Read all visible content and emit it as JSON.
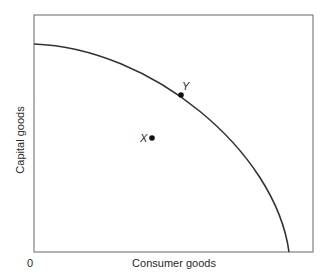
{
  "diagram": {
    "axes": {
      "x_label": "Consumer goods",
      "y_label": "Capital goods",
      "origin_label": "0"
    },
    "points": [
      {
        "label": "Y",
        "position": "on curve"
      },
      {
        "label": "X",
        "position": "inside curve"
      }
    ],
    "colors": {
      "frame": "#8a8a8a",
      "curve": "#333333",
      "point": "#111111",
      "text": "#2a2a2a"
    }
  }
}
